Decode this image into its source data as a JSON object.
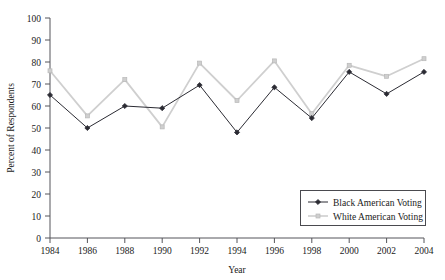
{
  "chart_data": {
    "type": "line",
    "title": "",
    "xlabel": "Year",
    "ylabel": "Percent of Respondents",
    "categories": [
      "1984",
      "1986",
      "1988",
      "1990",
      "1992",
      "1994",
      "1996",
      "1998",
      "2000",
      "2002",
      "2004"
    ],
    "x": [
      1984,
      1986,
      1988,
      1990,
      1992,
      1994,
      1996,
      1998,
      2000,
      2002,
      2004
    ],
    "xlim": [
      1984,
      2004
    ],
    "ylim": [
      0,
      100
    ],
    "y_ticks": [
      0,
      10,
      20,
      30,
      40,
      50,
      60,
      70,
      80,
      90,
      100
    ],
    "y_tick_labels": [
      "0",
      "10",
      "20",
      "30",
      "40",
      "50",
      "60",
      "70",
      "80",
      "90",
      "100"
    ],
    "grid": false,
    "legend_position": "lower right",
    "series": [
      {
        "name": "Black American Voting",
        "color": "#2b2b33",
        "marker": "diamond",
        "values": [
          65,
          50,
          60,
          59,
          69.5,
          48,
          68.5,
          54.5,
          75.5,
          65.5,
          75.5
        ]
      },
      {
        "name": "White American Voting",
        "color": "#cfcfcf",
        "marker": "square",
        "values": [
          76,
          55.5,
          72,
          50.5,
          79.5,
          62.5,
          80.5,
          56.5,
          78.5,
          73.5,
          81.5
        ]
      }
    ]
  },
  "axes": {
    "axis_color": "#55555a",
    "text_color": "#1a1a1a"
  },
  "legend": {
    "border_color": "#4a4a4f",
    "background": "#ffffff"
  }
}
